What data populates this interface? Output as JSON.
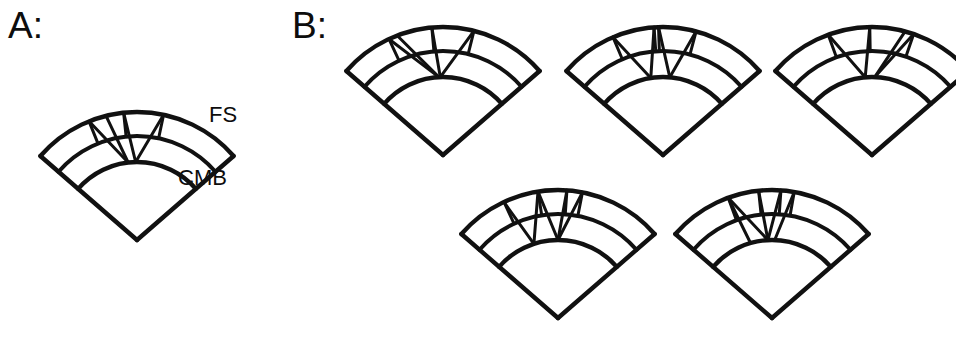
{
  "figure": {
    "background_color": "#ffffff",
    "stroke_color": "#111111",
    "panels": [
      {
        "id": "A",
        "letter": "A:",
        "wedges": [
          {
            "name": "wedge-a-1",
            "cx": 137,
            "cy": 240,
            "r_cmb": 78,
            "r_mid": 104,
            "r_fs": 128,
            "a0": -139,
            "a1": -41,
            "rays": [
              {
                "from_deg": -104,
                "to_deg": -96.5
              },
              {
                "from_deg": -112,
                "to_deg": -96.5
              },
              {
                "from_deg": -96,
                "to_deg": -91
              },
              {
                "from_deg": -78,
                "to_deg": -91
              }
            ],
            "spokes_mid": [
              -112,
              -96,
              -78
            ]
          }
        ],
        "labels": [
          {
            "name": "fs",
            "text": "FS"
          },
          {
            "name": "cmb",
            "text": "CMB"
          }
        ]
      },
      {
        "id": "B",
        "letter": "B:",
        "wedges": [
          {
            "name": "wedge-b-1",
            "cx": 443,
            "cy": 155,
            "r_cmb": 78,
            "r_mid": 104,
            "r_fs": 128,
            "a0": -139,
            "a1": -41,
            "rays": [
              {
                "from_deg": -115,
                "to_deg": -93
              },
              {
                "from_deg": -111,
                "to_deg": -93
              },
              {
                "from_deg": -95,
                "to_deg": -92
              },
              {
                "from_deg": -76,
                "to_deg": -92
              }
            ],
            "spokes_mid": [
              -115,
              -95,
              -76
            ]
          },
          {
            "name": "wedge-b-2",
            "cx": 663,
            "cy": 155,
            "r_cmb": 78,
            "r_mid": 104,
            "r_fs": 128,
            "a0": -139,
            "a1": -41,
            "rays": [
              {
                "from_deg": -113,
                "to_deg": -99
              },
              {
                "from_deg": -94,
                "to_deg": -99
              },
              {
                "from_deg": -92,
                "to_deg": -85
              },
              {
                "from_deg": -75,
                "to_deg": -85
              }
            ],
            "spokes_mid": [
              -113,
              -94,
              -92,
              -75
            ]
          },
          {
            "name": "wedge-b-3",
            "cx": 872,
            "cy": 155,
            "r_cmb": 78,
            "r_mid": 104,
            "r_fs": 128,
            "a0": -139,
            "a1": -41,
            "rays": [
              {
                "from_deg": -110,
                "to_deg": -95
              },
              {
                "from_deg": -91,
                "to_deg": -95
              },
              {
                "from_deg": -75,
                "to_deg": -88
              },
              {
                "from_deg": -71,
                "to_deg": -88
              }
            ],
            "spokes_mid": [
              -110,
              -91,
              -71
            ]
          },
          {
            "name": "wedge-b-4",
            "cx": 558,
            "cy": 318,
            "r_cmb": 78,
            "r_mid": 104,
            "r_fs": 128,
            "a0": -139,
            "a1": -41,
            "rays": [
              {
                "from_deg": -115,
                "to_deg": -108
              },
              {
                "from_deg": -99,
                "to_deg": -108
              },
              {
                "from_deg": -99,
                "to_deg": -90
              },
              {
                "from_deg": -79,
                "to_deg": -90
              },
              {
                "from_deg": -86,
                "to_deg": -90
              }
            ],
            "spokes_mid": [
              -115,
              -99,
              -86,
              -79
            ]
          },
          {
            "name": "wedge-b-5",
            "cx": 772,
            "cy": 318,
            "r_cmb": 78,
            "r_mid": 104,
            "r_fs": 128,
            "a0": -139,
            "a1": -41,
            "rays": [
              {
                "from_deg": -110,
                "to_deg": -106
              },
              {
                "from_deg": -110,
                "to_deg": -93
              },
              {
                "from_deg": -96,
                "to_deg": -93
              },
              {
                "from_deg": -86,
                "to_deg": -93
              },
              {
                "from_deg": -80,
                "to_deg": -88
              }
            ],
            "spokes_mid": [
              -110,
              -96,
              -86,
              -80
            ]
          }
        ]
      }
    ]
  }
}
